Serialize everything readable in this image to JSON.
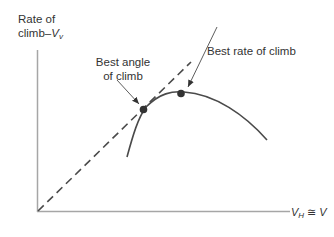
{
  "diagram": {
    "y_axis": {
      "label_line1": "Rate of",
      "label_line2": "climb–",
      "var": "V",
      "var_sub": "v"
    },
    "x_axis": {
      "var": "V",
      "var_sub": "H",
      "approx": " ≅ ",
      "var2": "V"
    },
    "annotations": {
      "best_angle_line1": "Best angle",
      "best_angle_line2": "of climb",
      "best_rate": "Best rate of climb"
    },
    "elements": {
      "curve": "rate-of-climb curve (parabolic)",
      "tangent": "dashed tangent line from origin",
      "points": [
        "best angle of climb point (tangency)",
        "best rate of climb point (maximum)"
      ]
    },
    "colors": {
      "axis": "#a6a6a6",
      "curve": "#4a4a4a",
      "text": "#333333",
      "point": "#333333"
    }
  }
}
